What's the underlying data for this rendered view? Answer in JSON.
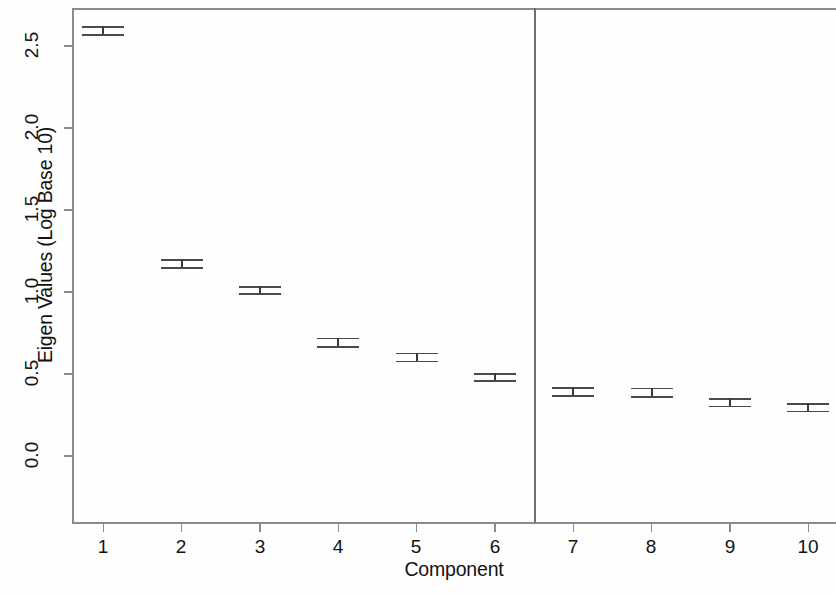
{
  "chart_data": {
    "type": "scatter",
    "title": "",
    "xlabel": "Component",
    "ylabel": "Eigen Values (Log Base 10)",
    "categories": [
      "1",
      "2",
      "3",
      "4",
      "5",
      "6",
      "7",
      "8",
      "9",
      "10"
    ],
    "x": [
      1,
      2,
      3,
      4,
      5,
      6,
      7,
      8,
      9,
      10
    ],
    "values": [
      2.59,
      1.17,
      1.01,
      0.69,
      0.6,
      0.48,
      0.39,
      0.385,
      0.32,
      0.29
    ],
    "error_low": [
      2.565,
      1.145,
      0.985,
      0.665,
      0.575,
      0.455,
      0.365,
      0.36,
      0.3,
      0.27
    ],
    "error_high": [
      2.615,
      1.195,
      1.03,
      0.715,
      0.625,
      0.5,
      0.415,
      0.41,
      0.345,
      0.315
    ],
    "xlim": [
      0.6,
      10.4
    ],
    "ylim": [
      -0.42,
      2.73
    ],
    "yticks": [
      0.0,
      0.5,
      1.0,
      1.5,
      2.0,
      2.5
    ],
    "ytick_labels": [
      "0.0",
      "0.5",
      "1.0",
      "1.5",
      "2.0",
      "2.5"
    ],
    "xticks": [
      1,
      2,
      3,
      4,
      5,
      6,
      7,
      8,
      9,
      10
    ],
    "xtick_labels": [
      "1",
      "2",
      "3",
      "4",
      "5",
      "6",
      "7",
      "8",
      "9",
      "10"
    ],
    "grid": false,
    "legend": null,
    "annotations": [
      {
        "type": "vertical-line",
        "x": 6.5,
        "label": "retention-cutoff"
      }
    ],
    "marker_style": "error-bar-with-caps",
    "colors": {
      "marker": "#3a3a3a",
      "cap": "#4a4a4a",
      "axis": "#8a8a8a",
      "divider": "#6f6f6f",
      "text": "#121212",
      "background": "#fefefe"
    }
  }
}
